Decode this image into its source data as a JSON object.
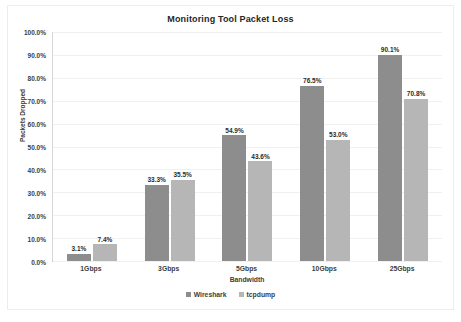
{
  "chart_data": {
    "type": "bar",
    "title": "Monitoring Tool Packet Loss",
    "xlabel": "Bandwidth",
    "ylabel": "Packets Dropped",
    "categories": [
      "1Gbps",
      "3Gbps",
      "5Gbps",
      "10Gbps",
      "25Gbps"
    ],
    "series": [
      {
        "name": "Wireshark",
        "color": "#8d8d8d",
        "values": [
          3.1,
          33.3,
          54.9,
          76.5,
          90.1
        ],
        "labels": [
          "3.1%",
          "33.3%",
          "54.9%",
          "76.5%",
          "90.1%"
        ]
      },
      {
        "name": "tcpdump",
        "color": "#b6b6b6",
        "values": [
          7.4,
          35.5,
          43.6,
          53.0,
          70.8
        ],
        "labels": [
          "7.4%",
          "35.5%",
          "43.6%",
          "53.0%",
          "70.8%"
        ]
      }
    ],
    "ylim": [
      0,
      100
    ],
    "ytick_values": [
      0,
      10,
      20,
      30,
      40,
      50,
      60,
      70,
      80,
      90,
      100
    ],
    "ytick_labels": [
      "0.0%",
      "10.0%",
      "20.0%",
      "30.0%",
      "40.0%",
      "50.0%",
      "60.0%",
      "70.0%",
      "80.0%",
      "90.0%",
      "100.0%"
    ],
    "grid": true,
    "legend_position": "bottom"
  }
}
